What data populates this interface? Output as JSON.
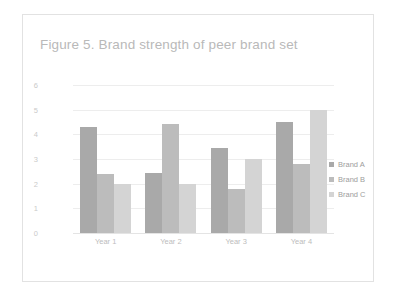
{
  "chart_data": {
    "type": "bar",
    "title": "Figure 5. Brand strength of peer brand set",
    "xlabel": "",
    "ylabel": "",
    "categories": [
      "Year 1",
      "Year 2",
      "Year 3",
      "Year 4"
    ],
    "series": [
      {
        "name": "Brand A",
        "color": "#a9a9a9",
        "values": [
          4.3,
          2.45,
          3.45,
          4.5
        ]
      },
      {
        "name": "Brand B",
        "color": "#bcbcbc",
        "values": [
          2.4,
          4.4,
          1.8,
          2.8
        ]
      },
      {
        "name": "Brand C",
        "color": "#d4d4d4",
        "values": [
          2.0,
          2.0,
          3.0,
          5.0
        ]
      }
    ],
    "ylim": [
      0,
      6
    ],
    "yticks": [
      "6",
      "5",
      "4",
      "3",
      "2",
      "1",
      "0"
    ],
    "grid": true,
    "legend_position": "right"
  },
  "legend": {
    "items": [
      {
        "label": "Brand A"
      },
      {
        "label": "Brand B"
      },
      {
        "label": "Brand C"
      }
    ]
  }
}
